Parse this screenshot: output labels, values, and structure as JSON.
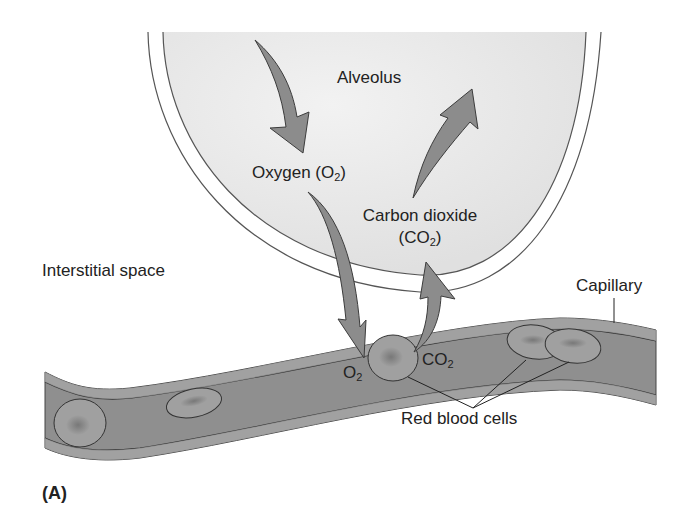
{
  "figure": {
    "panel_label": "(A)",
    "colors": {
      "background": "#ffffff",
      "alveolus_fill": "#e8e8e8",
      "alveolus_outline": "#555555",
      "capillary_fill": "#8f8f8f",
      "capillary_wall": "#a6a6a6",
      "red_blood_cell_fill": "#a0a0a0",
      "red_blood_cell_nucleus_shade": "#6e6e6e",
      "arrow_fill": "#8c8c8c",
      "arrow_outline": "#3c3c3c",
      "text": "#222222"
    }
  },
  "labels": {
    "alveolus": "Alveolus",
    "oxygen": {
      "prefix": "Oxygen (O",
      "subscript": "2",
      "suffix": ")"
    },
    "carbon_dioxide": {
      "line1": "Carbon dioxide",
      "line2_prefix": "(CO",
      "line2_subscript": "2",
      "line2_suffix": ")"
    },
    "interstitial_space": "Interstitial space",
    "capillary": "Capillary",
    "o2_at_cell": {
      "prefix": "O",
      "subscript": "2"
    },
    "co2_at_cell": {
      "prefix": "CO",
      "subscript": "2"
    },
    "red_blood_cells": "Red blood cells"
  }
}
